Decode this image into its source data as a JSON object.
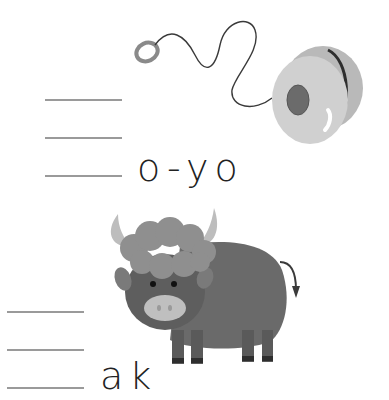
{
  "worksheet": {
    "exercises": [
      {
        "picture": "yo-yo",
        "word_fragment": "o-yo",
        "blank_lines": 3
      },
      {
        "picture": "yak",
        "word_fragment": "ak",
        "blank_lines": 3
      }
    ]
  },
  "colors": {
    "line": "#9a9a9a",
    "text": "#222222",
    "yoyo_body": "#c9c9c9",
    "yoyo_hub": "#6b6b6b",
    "yak_body": "#6a6a6a",
    "yak_fur": "#8f8f8f",
    "yak_horn": "#bdbdbd",
    "yak_snout": "#bfbfbf"
  }
}
